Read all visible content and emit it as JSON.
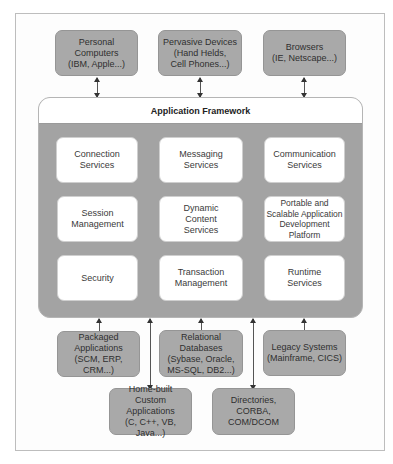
{
  "diagram": {
    "top_clients": [
      {
        "label": "Personal\nComputers\n(IBM, Apple...)"
      },
      {
        "label": "Pervasive Devices\n(Hand Helds,\nCell Phones...)"
      },
      {
        "label": "Browsers\n(IE, Netscape...)"
      }
    ],
    "framework": {
      "title": "Application Framework",
      "services": [
        {
          "label": "Connection\nServices"
        },
        {
          "label": "Messaging\nServices"
        },
        {
          "label": "Communication\nServices"
        },
        {
          "label": "Session\nManagement"
        },
        {
          "label": "Dynamic\nContent\nServices"
        },
        {
          "label": "Portable and\nScalable Application\nDevelopment\nPlatform"
        },
        {
          "label": "Security"
        },
        {
          "label": "Transaction\nManagement"
        },
        {
          "label": "Runtime\nServices"
        }
      ]
    },
    "backends": [
      {
        "label": "Packaged\nApplications\n(SCM, ERP, CRM...)"
      },
      {
        "label": "Relational\nDatabases\n(Sybase, Oracle,\nMS-SQL, DB2...)"
      },
      {
        "label": "Legacy Systems\n(Mainframe, CICS)"
      },
      {
        "label": "Home-built\nCustom\nApplications\n(C, C++, VB, Java...)"
      },
      {
        "label": "Directories,\nCORBA,\nCOM/DCOM"
      }
    ],
    "colors": {
      "box_gray": "#a9a9a9",
      "framework_gray": "#a3a3a3",
      "service_white": "#ffffff",
      "frame_border": "#bdbdbd"
    }
  }
}
